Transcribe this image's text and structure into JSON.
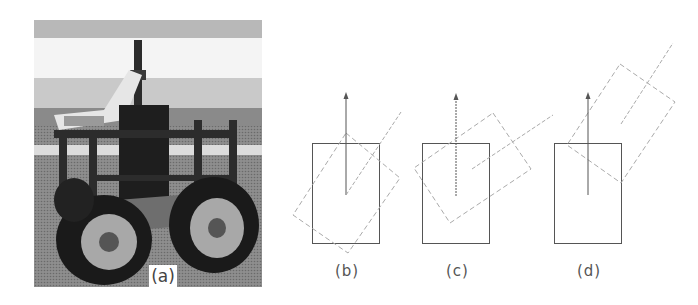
{
  "figure": {
    "panels": [
      {
        "id": "a",
        "label": "(a)",
        "type": "photo",
        "description": "four-wheeled mobile robot with mast and laptop"
      },
      {
        "id": "b",
        "label": "(b)",
        "type": "diagram",
        "description": "original pose (solid) and rotated pose (dashed), rotation about body center"
      },
      {
        "id": "c",
        "label": "(c)",
        "type": "diagram",
        "description": "original pose (solid) and rotated/translated pose (dashed)"
      },
      {
        "id": "d",
        "label": "(d)",
        "type": "diagram",
        "description": "original pose (solid) and rotated pose displaced forward (dashed)"
      }
    ],
    "colors": {
      "solid_line": "#555555",
      "dashed_line": "#aaaaaa",
      "label_text": "#555555"
    }
  }
}
